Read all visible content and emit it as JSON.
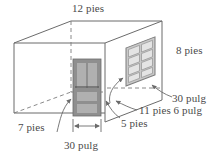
{
  "figure": {
    "type": "technical-drawing",
    "colors": {
      "line": "#6b6b6b",
      "text": "#4a4a4a",
      "door_fill": "#8c8c8c",
      "door_panel": "#a6a6a6",
      "window_frame": "#9b9b9b",
      "window_pane": "#dcdcdc",
      "background": "#ffffff"
    },
    "labels": {
      "top_width": "12 pies",
      "right_height": "8 pies",
      "window_width": "30 pulg",
      "right_depth": "11 pies 6 pulg",
      "five_pies": "5 pies",
      "seven_pies": "7 pies",
      "door_width": "30 pulg"
    },
    "annotations": {
      "door": {
        "name": "door",
        "panels": 4,
        "dimension": "30 pulg"
      },
      "window": {
        "name": "window",
        "columns": 2,
        "rows": 4,
        "dimension": "30 pulg"
      }
    },
    "dimensions": [
      {
        "label": "12 pies",
        "edge": "top-back-width"
      },
      {
        "label": "8 pies",
        "edge": "right-height"
      },
      {
        "label": "11 pies 6 pulg",
        "edge": "right-face-width"
      },
      {
        "label": "5 pies",
        "edge": "door-to-corner"
      },
      {
        "label": "7 pies",
        "edge": "left-to-door"
      },
      {
        "label": "30 pulg",
        "edge": "door-width"
      },
      {
        "label": "30 pulg",
        "edge": "window-width"
      }
    ]
  }
}
